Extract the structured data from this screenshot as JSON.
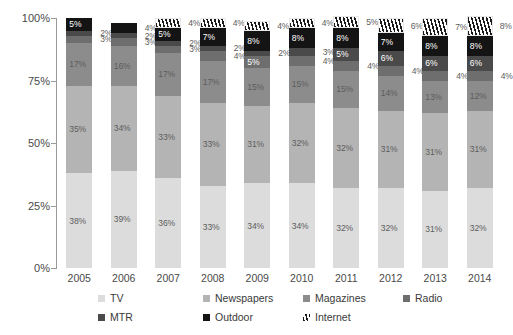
{
  "chart_data": {
    "type": "bar",
    "subtype": "stacked-percent",
    "title": "",
    "subtitle": "",
    "xlabel": "",
    "ylabel": "",
    "ylim": [
      0,
      100
    ],
    "ytick_labels": [
      "0%",
      "25%",
      "50%",
      "75%",
      "100%"
    ],
    "ytick_values": [
      0,
      25,
      50,
      75,
      100
    ],
    "grid": false,
    "legend_position": "bottom",
    "categories": [
      "2005",
      "2006",
      "2007",
      "2008",
      "2009",
      "2010",
      "2011",
      "2012",
      "2013",
      "2014"
    ],
    "series": [
      {
        "name": "TV",
        "color": "#dcdcdc",
        "pattern": "solid",
        "values": [
          38,
          39,
          36,
          33,
          34,
          34,
          32,
          32,
          31,
          32
        ]
      },
      {
        "name": "Newspapers",
        "color": "#b4b4b4",
        "pattern": "solid",
        "values": [
          35,
          34,
          33,
          33,
          31,
          32,
          32,
          31,
          31,
          31
        ]
      },
      {
        "name": "Magazines",
        "color": "#8c8c8c",
        "pattern": "solid",
        "values": [
          17,
          16,
          17,
          17,
          15,
          15,
          15,
          14,
          13,
          12
        ]
      },
      {
        "name": "Radio",
        "color": "#6e6e6e",
        "pattern": "solid",
        "values": [
          3,
          3,
          3,
          4,
          5,
          4,
          4,
          4,
          4,
          4
        ]
      },
      {
        "name": "MTR",
        "color": "#4a4a4a",
        "pattern": "solid",
        "values": [
          2,
          2,
          2,
          2,
          2,
          3,
          5,
          6,
          6,
          6
        ]
      },
      {
        "name": "Outdoor",
        "color": "#141414",
        "pattern": "solid",
        "values": [
          5,
          4,
          5,
          7,
          8,
          8,
          8,
          7,
          8,
          8
        ]
      },
      {
        "name": "Internet",
        "color": "#ffffff",
        "pattern": "hatch",
        "values": [
          0,
          0,
          4,
          4,
          4,
          4,
          5,
          6,
          7,
          8
        ]
      }
    ],
    "value_labels": {
      "2005": {
        "TV": "38%",
        "Newspapers": "35%",
        "Magazines": "17%",
        "Radio": "3%",
        "MTR": "2%",
        "Outdoor": "5%",
        "Internet": ""
      },
      "2006": {
        "TV": "39%",
        "Newspapers": "34%",
        "Magazines": "16%",
        "Radio": "3%",
        "MTR": "2%",
        "Outdoor": "4%",
        "Internet": ""
      },
      "2007": {
        "TV": "36%",
        "Newspapers": "33%",
        "Magazines": "17%",
        "Radio": "3%",
        "MTR": "2%",
        "Outdoor": "5%",
        "Internet": "4%"
      },
      "2008": {
        "TV": "33%",
        "Newspapers": "33%",
        "Magazines": "17%",
        "Radio": "4%",
        "MTR": "2%",
        "Outdoor": "7%",
        "Internet": "4%"
      },
      "2009": {
        "TV": "34%",
        "Newspapers": "31%",
        "Magazines": "15%",
        "Radio": "5%",
        "MTR": "2%",
        "Outdoor": "8%",
        "Internet": "4%"
      },
      "2010": {
        "TV": "34%",
        "Newspapers": "32%",
        "Magazines": "15%",
        "Radio": "4%",
        "MTR": "3%",
        "Outdoor": "8%",
        "Internet": "4%"
      },
      "2011": {
        "TV": "32%",
        "Newspapers": "32%",
        "Magazines": "15%",
        "Radio": "4%",
        "MTR": "5%",
        "Outdoor": "8%",
        "Internet": "5%"
      },
      "2012": {
        "TV": "32%",
        "Newspapers": "31%",
        "Magazines": "14%",
        "Radio": "4%",
        "MTR": "6%",
        "Outdoor": "7%",
        "Internet": "6%"
      },
      "2013": {
        "TV": "31%",
        "Newspapers": "31%",
        "Magazines": "13%",
        "Radio": "4%",
        "MTR": "6%",
        "Outdoor": "8%",
        "Internet": "7%"
      },
      "2014": {
        "TV": "32%",
        "Newspapers": "31%",
        "Magazines": "12%",
        "Radio": "4%",
        "MTR": "6%",
        "Outdoor": "8%",
        "Internet": "8%"
      }
    },
    "legend": [
      {
        "label": "TV",
        "color": "#dcdcdc",
        "pattern": "solid"
      },
      {
        "label": "Newspapers",
        "color": "#b4b4b4",
        "pattern": "solid"
      },
      {
        "label": "Magazines",
        "color": "#8c8c8c",
        "pattern": "solid"
      },
      {
        "label": "Radio",
        "color": "#6e6e6e",
        "pattern": "solid"
      },
      {
        "label": "MTR",
        "color": "#4a4a4a",
        "pattern": "solid"
      },
      {
        "label": "Outdoor",
        "color": "#141414",
        "pattern": "solid"
      },
      {
        "label": "Internet",
        "color": "#ffffff",
        "pattern": "hatch"
      }
    ]
  },
  "axis": {
    "y_labels": [
      "100%",
      "75%",
      "50%",
      "25%",
      "0%"
    ]
  }
}
